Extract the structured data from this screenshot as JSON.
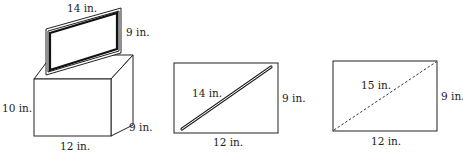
{
  "figures": [
    {
      "name": "tv-on-box",
      "screen": {
        "width_label": "14 in.",
        "height_label": "9 in."
      },
      "box": {
        "height_label": "10 in.",
        "width_label": "12 in.",
        "depth_label": "9 in."
      }
    },
    {
      "name": "rectangle-with-rod",
      "diagonal_label": "14 in.",
      "height_label": "9 in.",
      "width_label": "12 in."
    },
    {
      "name": "rectangle-with-dashed-diagonal",
      "diagonal_label": "15 in.",
      "height_label": "9 in.",
      "width_label": "12 in."
    }
  ],
  "colors": {
    "line": "#222222",
    "background": "#ffffff"
  }
}
